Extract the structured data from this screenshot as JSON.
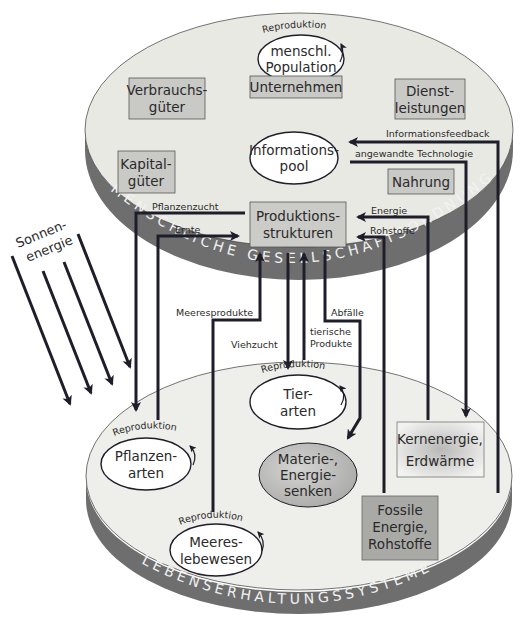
{
  "upper_system": {
    "band_label": "MENSCHLICHE GESELLSCHAFTSORDNUNG",
    "nodes": {
      "population": {
        "reproduction_label": "Reproduktion",
        "line1": "menschl.",
        "line2": "Population"
      },
      "unternehmen": "Unternehmen",
      "verbrauchsgueter": {
        "line1": "Verbrauchs-",
        "line2": "güter"
      },
      "dienstleistungen": {
        "line1": "Dienst-",
        "line2": "leistungen"
      },
      "kapitalgueter": {
        "line1": "Kapital-",
        "line2": "güter"
      },
      "informationspool": {
        "line1": "Informations-",
        "line2": "pool"
      },
      "nahrung": "Nahrung",
      "produktionsstrukturen": {
        "line1": "Produktions-",
        "line2": "strukturen"
      }
    }
  },
  "lower_system": {
    "band_label": "LEBENSERHALTUNGSSYSTEME",
    "nodes": {
      "tierarten": {
        "reproduction_label": "Reproduktion",
        "line1": "Tier-",
        "line2": "arten"
      },
      "pflanzenarten": {
        "reproduction_label": "Reproduktion",
        "line1": "Pflanzen-",
        "line2": "arten"
      },
      "meereslebewesen": {
        "reproduction_label": "Reproduktion",
        "line1": "Meeres-",
        "line2": "lebewesen"
      },
      "senken": {
        "line1": "Materie-,",
        "line2": "Energie-",
        "line3": "senken"
      },
      "kernenergie": {
        "line1": "Kernenergie,",
        "line2": "Erdwärme"
      },
      "fossile": {
        "line1": "Fossile",
        "line2": "Energie,",
        "line3": "Rohstoffe"
      }
    }
  },
  "sun": {
    "line1": "Sonnen-",
    "line2": "energie"
  },
  "flows": {
    "informationsfeedback": "Informationsfeedback",
    "angewandte_technologie": "angewandte Technologie",
    "pflanzenzucht": "Pflanzenzucht",
    "ernte": "Ernte",
    "energie": "Energie",
    "rohstoffe": "Rohstoffe",
    "meeresprodukte": "Meeresprodukte",
    "viehzucht": "Viehzucht",
    "tierische_produkte_1": "tierische",
    "tierische_produkte_2": "Produkte",
    "abfaelle": "Abfälle"
  },
  "colors": {
    "disc_face": "#ececE6",
    "band": "#6e6e6e",
    "box_fill": "#c9c9c6",
    "box_dark": "#a9a9a6",
    "ellipse_fill": "#ffffff",
    "sink_fill": "#bdbdbb",
    "line": "#1e1e2a"
  }
}
